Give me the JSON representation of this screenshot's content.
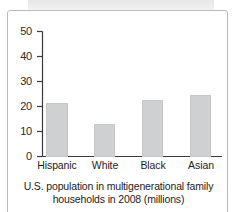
{
  "figure": {
    "caption_line_1": "U.S. population in multigenerational family",
    "caption_line_2": "households in 2008 (millions)",
    "frame_color": "#b9bcbe",
    "bar_color": "#cfd0d1",
    "axis_color": "#3a3a3a",
    "text_color": "#1d1d1d"
  },
  "chart_data": {
    "type": "bar",
    "title": "U.S. population in multigenerational family households in 2008 (millions)",
    "xlabel": "",
    "ylabel": "",
    "categories": [
      "Hispanic",
      "White",
      "Black",
      "Asian"
    ],
    "values": [
      21.5,
      13,
      22.5,
      24.5
    ],
    "ylim": [
      0,
      50
    ],
    "yticks": [
      0,
      10,
      20,
      30,
      40,
      50
    ],
    "ytick_labels": [
      "0",
      "10",
      "20",
      "30",
      "40",
      "50"
    ],
    "grid": false,
    "legend": false,
    "units": "millions"
  }
}
